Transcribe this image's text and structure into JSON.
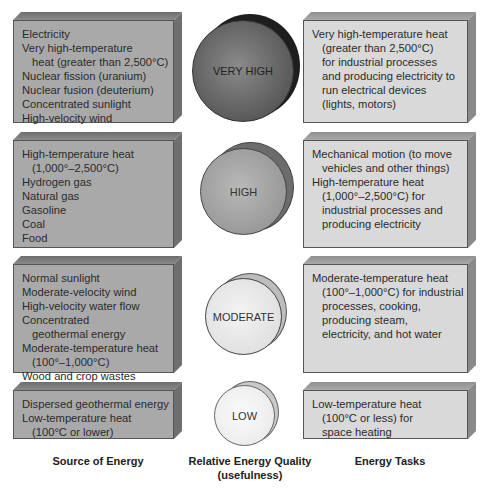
{
  "rows": [
    {
      "quality": "VERY HIGH",
      "source": [
        {
          "text": "Electricity",
          "indent": false
        },
        {
          "text": "Very high-temperature",
          "indent": false
        },
        {
          "text": "heat (greater than 2,500°C)",
          "indent": true
        },
        {
          "text": "Nuclear fission (uranium)",
          "indent": false
        },
        {
          "text": "Nuclear fusion (deuterium)",
          "indent": false
        },
        {
          "text": "Concentrated sunlight",
          "indent": false
        },
        {
          "text": "High-velocity wind",
          "indent": false
        }
      ],
      "task": [
        {
          "text": "Very high-temperature heat",
          "indent": false
        },
        {
          "text": "(greater than 2,500°C)",
          "indent": true
        },
        {
          "text": "for industrial  processes",
          "indent": true
        },
        {
          "text": "and producing electricity to",
          "indent": true
        },
        {
          "text": "run electrical devices",
          "indent": true
        },
        {
          "text": "(lights, motors)",
          "indent": true
        }
      ]
    },
    {
      "quality": "HIGH",
      "source": [
        {
          "text": "High-temperature heat",
          "indent": false
        },
        {
          "text": "(1,000°–2,500°C)",
          "indent": true
        },
        {
          "text": "Hydrogen gas",
          "indent": false
        },
        {
          "text": "Natural gas",
          "indent": false
        },
        {
          "text": "Gasoline",
          "indent": false
        },
        {
          "text": "Coal",
          "indent": false
        },
        {
          "text": "Food",
          "indent": false
        }
      ],
      "task": [
        {
          "text": "Mechanical motion (to move",
          "indent": false
        },
        {
          "text": "vehicles and other things)",
          "indent": true
        },
        {
          "text": "High-temperature heat",
          "indent": false
        },
        {
          "text": "(1,000°–2,500°C) for",
          "indent": true
        },
        {
          "text": "industrial processes and",
          "indent": true
        },
        {
          "text": "producing electricity",
          "indent": true
        }
      ]
    },
    {
      "quality": "MODERATE",
      "source": [
        {
          "text": "Normal sunlight",
          "indent": false
        },
        {
          "text": "Moderate-velocity wind",
          "indent": false
        },
        {
          "text": "High-velocity water flow",
          "indent": false
        },
        {
          "text": "Concentrated",
          "indent": false
        },
        {
          "text": "geothermal energy",
          "indent": true
        },
        {
          "text": "Moderate-temperature heat",
          "indent": false
        },
        {
          "text": "(100°–1,000°C)",
          "indent": true
        },
        {
          "text": "Wood and crop wastes",
          "indent": false
        }
      ],
      "task": [
        {
          "text": "Moderate-temperature heat",
          "indent": false
        },
        {
          "text": "(100°–1,000°C) for industrial",
          "indent": true
        },
        {
          "text": "processes, cooking,",
          "indent": true
        },
        {
          "text": "producing steam,",
          "indent": true
        },
        {
          "text": "electricity, and hot water",
          "indent": true
        }
      ]
    },
    {
      "quality": "LOW",
      "source": [
        {
          "text": "Dispersed geothermal energy",
          "indent": false
        },
        {
          "text": "Low-temperature heat",
          "indent": false
        },
        {
          "text": "(100°C or lower)",
          "indent": true
        }
      ],
      "task": [
        {
          "text": "Low-temperature heat",
          "indent": false
        },
        {
          "text": "(100°C or less) for",
          "indent": true
        },
        {
          "text": "space heating",
          "indent": true
        }
      ]
    }
  ],
  "captions": {
    "source": "Source of Energy",
    "quality_line1": "Relative Energy Quality",
    "quality_line2": "(usefulness)",
    "tasks": "Energy Tasks"
  },
  "colors": {
    "source_box": "#a9a9a9",
    "task_box": "#d9d9d9",
    "very_high_sphere": "#555555",
    "high_sphere": "#9a9a9a",
    "moderate_sphere": "#dcdcdc",
    "low_sphere": "#f2f2f2"
  }
}
